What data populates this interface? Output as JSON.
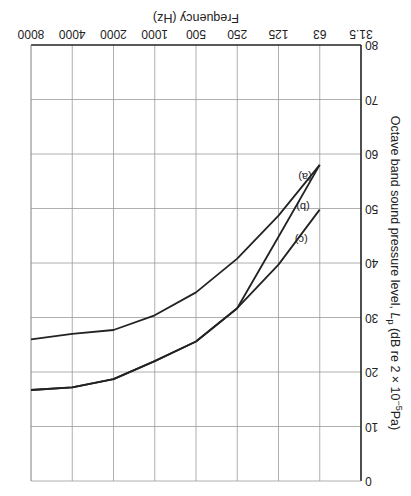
{
  "chart_data": {
    "type": "line",
    "orientation_note_visible": "figure rendered rotated 180 degrees",
    "title": "",
    "xlabel": "Frequency (Hz)",
    "ylabel": "Octave band sound pressure level, L_p (dB re 2 × 10⁻⁵Pa)",
    "x_ticks": [
      "31.5",
      "63",
      "125",
      "250",
      "500",
      "1000",
      "2000",
      "4000",
      "8000"
    ],
    "y_ticks": [
      "0",
      "10",
      "20",
      "30",
      "40",
      "50",
      "60",
      "70",
      "80"
    ],
    "ylim": [
      0,
      80
    ],
    "y_inverted": true,
    "grid": true,
    "series": [
      {
        "name": "(a)",
        "x": [
          "63",
          "125",
          "250",
          "500",
          "1000",
          "2000",
          "4000",
          "8000"
        ],
        "values": [
          58,
          48.7,
          40.8,
          34.6,
          30.4,
          27.7,
          27,
          26
        ]
      },
      {
        "name": "(b)",
        "x": [
          "63",
          "125",
          "250",
          "500",
          "1000",
          "2000",
          "4000",
          "8000"
        ],
        "values": [
          58,
          44.8,
          31.7,
          25.6,
          22,
          18.7,
          17.2,
          16.7
        ]
      },
      {
        "name": "(c)",
        "x": [
          "63",
          "125",
          "250",
          "500",
          "1000",
          "2000",
          "4000",
          "8000"
        ],
        "values": [
          49.8,
          39.7,
          31.7,
          25.6,
          22,
          18.7,
          17.2,
          16.7
        ]
      }
    ]
  },
  "labels": {
    "xlabel": "Frequency (Hz)",
    "ylabel_main": "Octave band sound pressure level, ",
    "ylabel_sym": "L",
    "ylabel_sub": "p",
    "ylabel_tail1": " (dB re 2 × 10",
    "ylabel_exp": "−5",
    "ylabel_tail2": "Pa)",
    "series_a": "(a)",
    "series_b": "(b)",
    "series_c": "(c)"
  }
}
